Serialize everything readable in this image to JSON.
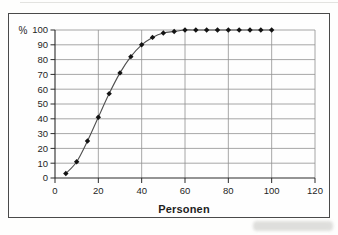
{
  "figure": {
    "kind": "scanned line chart",
    "background": "#fefefd",
    "frame_border_color": "#4a4a4a"
  },
  "chart_data": {
    "type": "line",
    "title": "",
    "xlabel": "Personen",
    "ylabel": "%",
    "x": [
      5,
      10,
      15,
      20,
      25,
      30,
      35,
      40,
      45,
      50,
      55,
      60,
      65,
      70,
      75,
      80,
      85,
      90,
      95,
      100
    ],
    "values": [
      3,
      11,
      25,
      41,
      57,
      71,
      82,
      90,
      95,
      98,
      99,
      100,
      100,
      100,
      100,
      100,
      100,
      100,
      100,
      100
    ],
    "xlim": [
      0,
      120
    ],
    "ylim": [
      0,
      100
    ],
    "x_ticks": [
      0,
      20,
      40,
      60,
      80,
      100,
      120
    ],
    "y_ticks": [
      0,
      10,
      20,
      30,
      40,
      50,
      60,
      70,
      80,
      90,
      100
    ],
    "grid": "both",
    "legend": "none",
    "marker": "diamond",
    "line_smooth": true,
    "colors": {
      "line": "#4f4f4f",
      "marker": "#131313",
      "grid": "#919191",
      "plot_border": "#777777",
      "axis": "#2b2b2b",
      "text": "#1f1f1f"
    }
  }
}
